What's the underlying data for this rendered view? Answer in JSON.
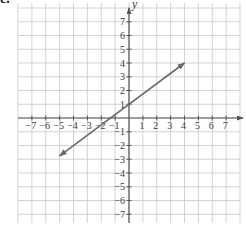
{
  "part_label": "c.",
  "chart_data": {
    "type": "line",
    "title": "",
    "xlabel": "",
    "ylabel": "y",
    "xlim": [
      -8,
      8
    ],
    "ylim": [
      -8,
      8
    ],
    "grid": true,
    "x_ticks": [
      -7,
      -6,
      -5,
      -4,
      -3,
      -2,
      -1,
      1,
      2,
      3,
      4,
      5,
      6,
      7
    ],
    "y_ticks": [
      -7,
      -6,
      -5,
      -4,
      -3,
      -2,
      -1,
      1,
      2,
      3,
      4,
      5,
      6,
      7
    ],
    "x_tick_labels": [
      "−7",
      "−6",
      "−5",
      "−4",
      "−3",
      "−2",
      "−1",
      "1",
      "2",
      "3",
      "4",
      "5",
      "6",
      "7"
    ],
    "y_tick_labels": [
      "−7",
      "−6",
      "−5",
      "−4",
      "−3",
      "−2",
      "−1",
      "1",
      "2",
      "3",
      "4",
      "5",
      "6",
      "7"
    ],
    "series": [
      {
        "name": "line",
        "equation": "y = 3/4 x + 1",
        "x": [
          -5,
          0,
          4
        ],
        "y": [
          -2.75,
          1,
          4
        ],
        "arrows": "both",
        "color": "#666666"
      }
    ],
    "colors": {
      "grid": "#c8c8c8",
      "axis": "#555555",
      "line": "#6b6b6b",
      "text": "#3a3a3a"
    }
  }
}
